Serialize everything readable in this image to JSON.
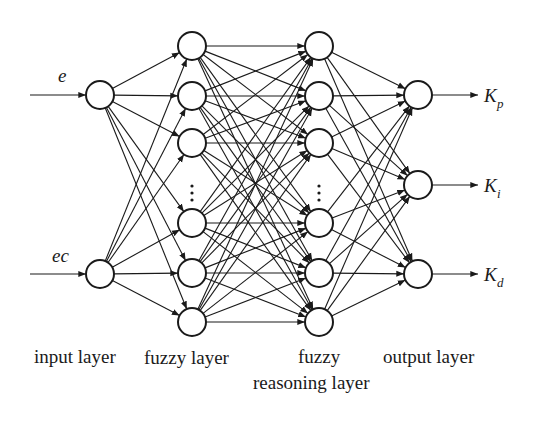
{
  "diagram": {
    "inputs": [
      {
        "id": "e",
        "label": "e",
        "x": 100,
        "y": 95
      },
      {
        "id": "ec",
        "label": "ec",
        "x": 100,
        "y": 274
      }
    ],
    "fuzzy_layer": {
      "x": 192,
      "nodes_y": [
        46,
        96,
        143,
        223,
        273,
        322
      ],
      "ellipsis_y": 193
    },
    "reasoning_layer": {
      "x": 319,
      "nodes_y": [
        46,
        96,
        143,
        223,
        273,
        322
      ],
      "ellipsis_y": 193
    },
    "outputs": [
      {
        "id": "Kp",
        "label": "K",
        "subscript": "p",
        "x": 418,
        "y": 95
      },
      {
        "id": "Ki",
        "label": "K",
        "subscript": "i",
        "x": 418,
        "y": 185
      },
      {
        "id": "Kd",
        "label": "K",
        "subscript": "d",
        "x": 418,
        "y": 274
      }
    ],
    "node_radius": 14,
    "layer_labels": {
      "input": "input layer",
      "fuzzy": "fuzzy layer",
      "reasoning_line1": "fuzzy",
      "reasoning_line2": "reasoning layer",
      "output": "output layer"
    },
    "colors": {
      "stroke": "#1a1a1a",
      "background": "#ffffff"
    }
  }
}
